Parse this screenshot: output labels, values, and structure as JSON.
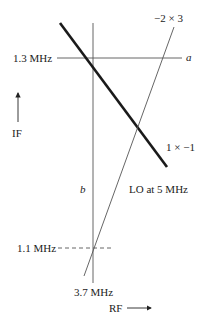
{
  "diagram": {
    "labels": {
      "if_1_3": "1.3 MHz",
      "if_1_1": "1.1 MHz",
      "rf_3_7": "3.7 MHz",
      "line_a": "a",
      "line_b": "b",
      "spur_minus2x3": "−2 × 3",
      "spur_1xminus1": "1 × −1",
      "lo_note": "LO at 5 MHz",
      "y_axis": "IF",
      "x_axis": "RF"
    },
    "colors": {
      "line": "#222222",
      "thin_line": "#555555"
    }
  }
}
